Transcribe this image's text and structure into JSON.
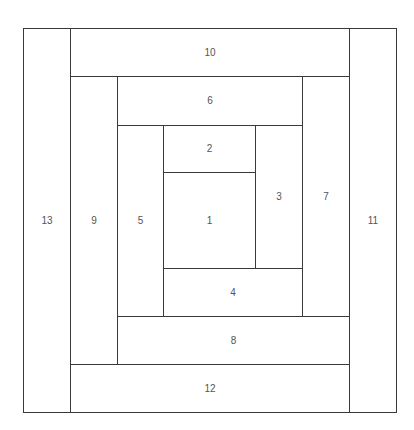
{
  "diagram": {
    "title": "",
    "type": "log-cabin-block-layout",
    "line_color": "#3a3a3a",
    "label_color": "#555555",
    "background": "#ffffff",
    "blocks": [
      {
        "id": "1",
        "label": "1",
        "x": 163,
        "y": 172,
        "w": 92,
        "h": 96
      },
      {
        "id": "2",
        "label": "2",
        "x": 163,
        "y": 125,
        "w": 92,
        "h": 47
      },
      {
        "id": "3",
        "label": "3",
        "x": 255,
        "y": 125,
        "w": 47,
        "h": 143
      },
      {
        "id": "4",
        "label": "4",
        "x": 163,
        "y": 268,
        "w": 139,
        "h": 48
      },
      {
        "id": "5",
        "label": "5",
        "x": 117,
        "y": 125,
        "w": 46,
        "h": 191
      },
      {
        "id": "6",
        "label": "6",
        "x": 117,
        "y": 76,
        "w": 185,
        "h": 49
      },
      {
        "id": "7",
        "label": "7",
        "x": 302,
        "y": 76,
        "w": 47,
        "h": 240
      },
      {
        "id": "8",
        "label": "8",
        "x": 117,
        "y": 316,
        "w": 232,
        "h": 48
      },
      {
        "id": "9",
        "label": "9",
        "x": 70,
        "y": 76,
        "w": 47,
        "h": 288
      },
      {
        "id": "10",
        "label": "10",
        "x": 70,
        "y": 28,
        "w": 279,
        "h": 48
      },
      {
        "id": "11",
        "label": "11",
        "x": 349,
        "y": 28,
        "w": 47,
        "h": 384
      },
      {
        "id": "12",
        "label": "12",
        "x": 70,
        "y": 364,
        "w": 279,
        "h": 48
      },
      {
        "id": "13",
        "label": "13",
        "x": 23,
        "y": 28,
        "w": 47,
        "h": 384
      }
    ],
    "frame": {
      "x": 23,
      "y": 28,
      "w": 373,
      "h": 384
    }
  }
}
